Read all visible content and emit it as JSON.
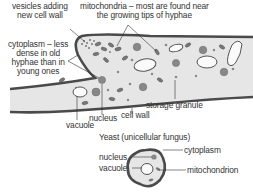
{
  "hypha": {
    "labels": {
      "vesicles": [
        "vesicles adding",
        "new cell wall"
      ],
      "mitochondria": [
        "mitochondria – most are found near",
        "the growing tips of hyphae"
      ],
      "cytoplasm": [
        "cytoplasm – less",
        "dense in old",
        "hyphae than in",
        "young ones"
      ],
      "storage_granule": "storage granule",
      "nucleus": "nucleus",
      "cell_wall": "cell wall",
      "vacuole": "vacuole"
    }
  },
  "yeast": {
    "title": "Yeast (unicellular fungus)",
    "labels": {
      "cytoplasm": "cytoplasm",
      "nucleus": "nucleus",
      "vacuole": "vacuole",
      "mitochondrion": "mitochondrion"
    }
  },
  "colors": {
    "wall": "#4a4a4a",
    "cytoplasm": "#e6e6e6",
    "organelle": "#777777",
    "text": "#333333"
  }
}
